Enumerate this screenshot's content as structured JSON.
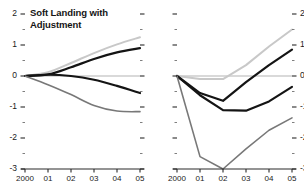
{
  "figure": {
    "background": "#ffffff",
    "panels": [
      {
        "id": "soft-landing",
        "title": "Soft Landing with\nAdjustment"
      },
      {
        "id": "harder-landing",
        "title": "Harder Landing"
      }
    ]
  },
  "axes": {
    "y_ticks": [
      "2",
      "1",
      "0",
      "-1",
      "-2",
      "-3"
    ],
    "y_values": [
      2,
      1,
      0,
      -1,
      -2,
      -3
    ],
    "x_ticks": [
      "2000",
      "01",
      "02",
      "03",
      "04",
      "05"
    ],
    "x_values": [
      2000,
      2001,
      2002,
      2003,
      2004,
      2005
    ],
    "ylim": [
      -3,
      2
    ],
    "xlim": [
      2000,
      2005
    ],
    "zero_line_color": "#b4b4b4",
    "axis_color": "#2a2a2a"
  },
  "chart_data": [
    {
      "type": "line",
      "title": "Soft Landing with Adjustment",
      "xlabel": "",
      "ylabel": "",
      "x": [
        2000,
        2001,
        2002,
        2003,
        2004,
        2005
      ],
      "ylim": [
        -3,
        2
      ],
      "xlim": [
        2000,
        2005
      ],
      "grid": false,
      "legend": "none",
      "series": [
        {
          "name": "light-gray-rising",
          "color": "#c8c8c8",
          "width": 2.0,
          "values": [
            0.0,
            0.12,
            0.42,
            0.74,
            1.02,
            1.25
          ]
        },
        {
          "name": "black-rising",
          "color": "#141414",
          "width": 2.2,
          "values": [
            0.0,
            0.05,
            0.28,
            0.55,
            0.76,
            0.9
          ]
        },
        {
          "name": "black-falling",
          "color": "#141414",
          "width": 2.2,
          "values": [
            0.0,
            0.04,
            0.0,
            -0.12,
            -0.32,
            -0.55
          ]
        },
        {
          "name": "gray-falling",
          "color": "#787878",
          "width": 1.6,
          "values": [
            0.0,
            -0.28,
            -0.6,
            -0.95,
            -1.13,
            -1.15
          ]
        }
      ]
    },
    {
      "type": "line",
      "title": "Harder Landing",
      "xlabel": "",
      "ylabel": "",
      "x": [
        2000,
        2001,
        2002,
        2003,
        2004,
        2005
      ],
      "ylim": [
        -3,
        2
      ],
      "xlim": [
        2000,
        2005
      ],
      "grid": false,
      "legend": "none",
      "series": [
        {
          "name": "light-gray-rising",
          "color": "#c8c8c8",
          "width": 2.0,
          "values": [
            0.0,
            -0.1,
            -0.1,
            0.35,
            0.95,
            1.5
          ]
        },
        {
          "name": "black-v-shallow",
          "color": "#141414",
          "width": 2.2,
          "values": [
            0.0,
            -0.55,
            -0.8,
            -0.2,
            0.35,
            0.85
          ]
        },
        {
          "name": "black-v-deep",
          "color": "#141414",
          "width": 2.2,
          "values": [
            0.0,
            -0.62,
            -1.1,
            -1.12,
            -0.82,
            -0.35
          ]
        },
        {
          "name": "gray-plunge",
          "color": "#787878",
          "width": 1.6,
          "values": [
            0.0,
            -2.6,
            -3.0,
            -2.35,
            -1.75,
            -1.35
          ]
        }
      ]
    }
  ]
}
